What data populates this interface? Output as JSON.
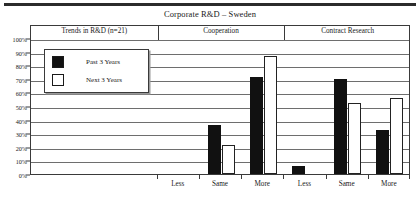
{
  "chart_data": {
    "type": "bar",
    "title": "Corporate R&D – Sweden",
    "xlabel": "",
    "ylabel": "",
    "ylim": [
      0,
      100
    ],
    "ytick_labels": [
      "100%",
      "90%",
      "80%",
      "70%",
      "60%",
      "50%",
      "40%",
      "30%",
      "20%",
      "10%",
      "0%"
    ],
    "ytick_values": [
      100,
      90,
      80,
      70,
      60,
      50,
      40,
      30,
      20,
      10,
      0
    ],
    "grid": true,
    "legend_position": "upper-left-inset",
    "panels": [
      {
        "label": "Trends in R&D (n=21)",
        "categories": []
      },
      {
        "label": "Cooperation",
        "categories": [
          "Less",
          "Same",
          "More"
        ]
      },
      {
        "label": "Contract Research",
        "categories": [
          "Less",
          "Same",
          "More"
        ]
      }
    ],
    "categories": [
      "Less",
      "Same",
      "More",
      "Less",
      "Same",
      "More"
    ],
    "series": [
      {
        "name": "Past 3 Years",
        "color": "#111111",
        "values": [
          0,
          36,
          71,
          6,
          70,
          32
        ]
      },
      {
        "name": "Next 3 Years",
        "color": "#ffffff",
        "values": [
          0,
          21,
          87,
          0,
          52,
          56
        ]
      }
    ]
  },
  "legend": {
    "items": [
      {
        "label": "Past 3 Years",
        "swatch": "filled"
      },
      {
        "label": "Next 3 Years",
        "swatch": "hollow"
      }
    ]
  }
}
